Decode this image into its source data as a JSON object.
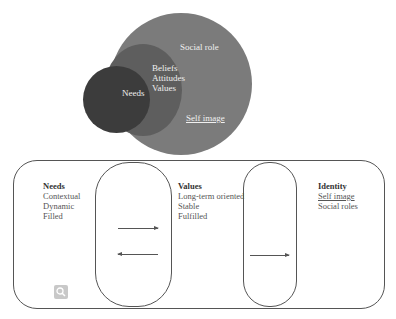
{
  "venn": {
    "outer_label": "Social role",
    "middle_lines": [
      "Beliefs",
      "Attitudes",
      "Values"
    ],
    "inner_label": "Needs",
    "outer_underlined_label": "Self image",
    "colors": {
      "outer": "#7b7b7b",
      "middle": "#5e5e5e",
      "inner": "#3c3c3c"
    }
  },
  "flow": {
    "needs": {
      "heading": "Needs",
      "items": [
        "Contextual",
        "Dynamic",
        "Filled"
      ]
    },
    "values": {
      "heading": "Values",
      "items": [
        "Long-term oriented",
        "Stable",
        "Fulfilled"
      ]
    },
    "identity": {
      "heading": "Identity",
      "items": [
        "Self image",
        "Social roles"
      ]
    }
  },
  "icons": {
    "zoom": "magnifier-icon"
  }
}
